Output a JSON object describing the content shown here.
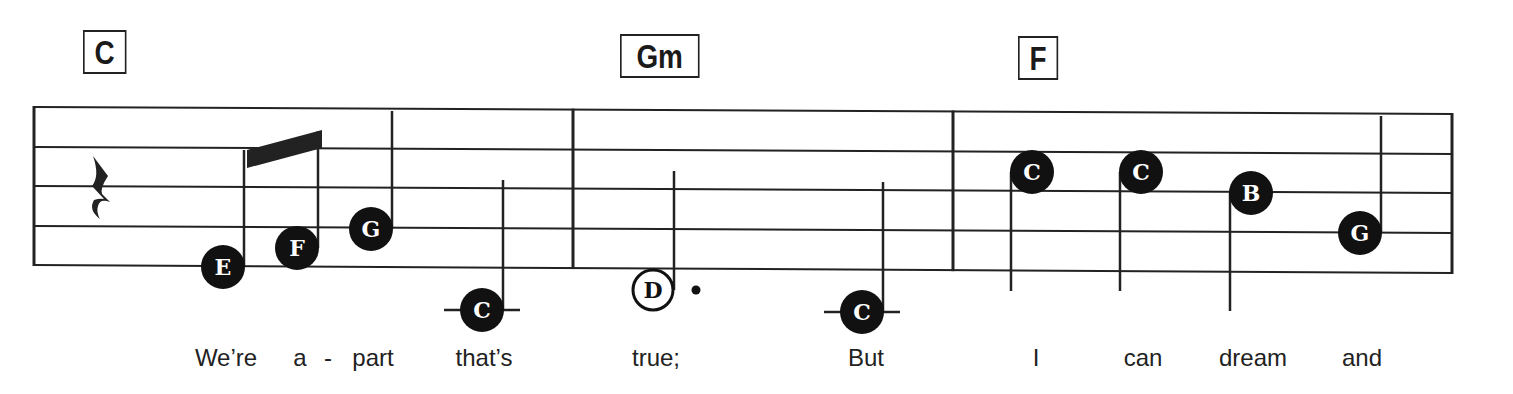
{
  "chords": [
    {
      "label": "C",
      "x": 83,
      "y": 30,
      "w": 40
    },
    {
      "label": "Gm",
      "x": 620,
      "y": 34,
      "w": 76
    },
    {
      "label": "F",
      "x": 1018,
      "y": 36,
      "w": 37
    }
  ],
  "staff": {
    "x_start": 34,
    "x_end": 1452,
    "lines_left_y": [
      107,
      147,
      186,
      226,
      265
    ],
    "lines_right_y": [
      114,
      154,
      193,
      233,
      273
    ],
    "barlines_x": [
      34,
      573,
      953,
      1452
    ],
    "line_color": "#222222"
  },
  "rest": {
    "type": "quarter-rest",
    "x": 98,
    "y": 186
  },
  "notes": [
    {
      "letter": "E",
      "x": 223,
      "y": 267,
      "filled": true,
      "stem": "up",
      "stem_top": 150,
      "ledger": false
    },
    {
      "letter": "F",
      "x": 297,
      "y": 248,
      "filled": true,
      "stem": "up",
      "stem_top": 131,
      "ledger": false
    },
    {
      "letter": "G",
      "x": 371,
      "y": 229,
      "filled": true,
      "stem": "up",
      "stem_top": 111,
      "ledger": false
    },
    {
      "letter": "C",
      "x": 482,
      "y": 310,
      "filled": true,
      "stem": "up",
      "stem_top": 180,
      "ledger": true
    },
    {
      "letter": "D",
      "x": 653,
      "y": 290,
      "filled": false,
      "dotted": true,
      "stem": "up",
      "stem_top": 171,
      "ledger": false
    },
    {
      "letter": "C",
      "x": 862,
      "y": 312,
      "filled": true,
      "stem": "up",
      "stem_top": 182,
      "ledger": true
    },
    {
      "letter": "C",
      "x": 1032,
      "y": 172,
      "filled": true,
      "stem": "down",
      "stem_bottom": 291,
      "ledger": false
    },
    {
      "letter": "C",
      "x": 1141,
      "y": 172,
      "filled": true,
      "stem": "down",
      "stem_bottom": 291,
      "ledger": false
    },
    {
      "letter": "B",
      "x": 1251,
      "y": 193,
      "filled": true,
      "stem": "down",
      "stem_bottom": 311,
      "ledger": false
    },
    {
      "letter": "G",
      "x": 1360,
      "y": 233,
      "filled": true,
      "stem": "up",
      "stem_top": 116,
      "ledger": false
    }
  ],
  "beam": {
    "x1": 247,
    "y1_top": 150,
    "x2": 322,
    "y2_top": 130,
    "thickness": 18
  },
  "lyrics": [
    {
      "text": "We’re",
      "x": 226
    },
    {
      "text": "a",
      "x": 300
    },
    {
      "text": "-",
      "x": 328
    },
    {
      "text": "part",
      "x": 373
    },
    {
      "text": "that’s",
      "x": 484
    },
    {
      "text": "true;",
      "x": 656
    },
    {
      "text": "But",
      "x": 866
    },
    {
      "text": "I",
      "x": 1036
    },
    {
      "text": "can",
      "x": 1143
    },
    {
      "text": "dream",
      "x": 1253
    },
    {
      "text": "and",
      "x": 1362
    }
  ]
}
